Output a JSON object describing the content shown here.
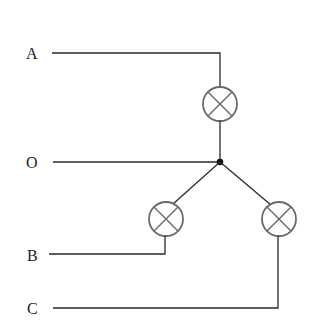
{
  "diagram": {
    "type": "three-phase star (Y) connection of lamps",
    "terminals": [
      {
        "id": "A",
        "label": "A"
      },
      {
        "id": "O",
        "label": "O"
      },
      {
        "id": "B",
        "label": "B"
      },
      {
        "id": "C",
        "label": "C"
      }
    ],
    "components": [
      {
        "id": "lamp-A",
        "type": "lamp",
        "between": [
          "A",
          "O"
        ]
      },
      {
        "id": "lamp-B",
        "type": "lamp",
        "between": [
          "O",
          "B"
        ]
      },
      {
        "id": "lamp-C",
        "type": "lamp",
        "between": [
          "O",
          "C"
        ]
      }
    ],
    "neutral_junction": "O"
  }
}
